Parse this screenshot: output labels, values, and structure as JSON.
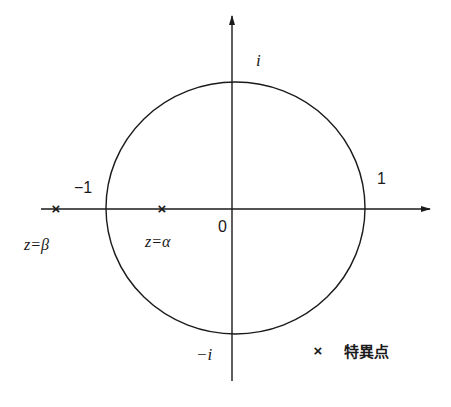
{
  "diagram": {
    "type": "complex-plane",
    "unit_circle": {
      "label": "unit circle |z|=1"
    },
    "axes": {
      "real_tick_neg": "−1",
      "real_tick_pos": "1",
      "imag_tick_pos": "i",
      "imag_tick_neg": "−i",
      "origin": "0"
    },
    "points": [
      {
        "name": "beta",
        "label": "z=β",
        "marker": "×"
      },
      {
        "name": "alpha",
        "label": "z=α",
        "marker": "×"
      }
    ],
    "legend": {
      "marker": "×",
      "label": "特異点"
    },
    "colors": {
      "stroke": "#1a1a1a",
      "background": "#ffffff"
    }
  }
}
